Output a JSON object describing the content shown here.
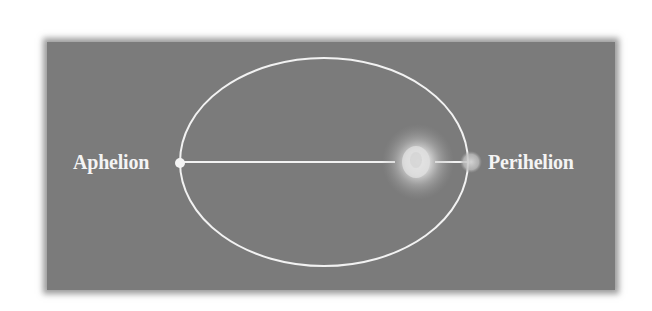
{
  "diagram": {
    "type": "orbit-ellipse",
    "labels": {
      "aphelion": "Aphelion",
      "perihelion": "Perihelion"
    },
    "colors": {
      "background": "#ffffff",
      "panel": "#7b7b7b",
      "orbit_line": "#f2f2f2",
      "label_text": "#f4f4f4",
      "sun_glow": "#e6e6e6"
    },
    "elements": {
      "orbit": {
        "shape": "ellipse"
      },
      "major_axis": {
        "shape": "line"
      },
      "sun": {
        "position": "focus-near-perihelion"
      },
      "planet": {
        "position": "perihelion"
      },
      "aphelion_marker": {
        "position": "aphelion"
      }
    }
  }
}
